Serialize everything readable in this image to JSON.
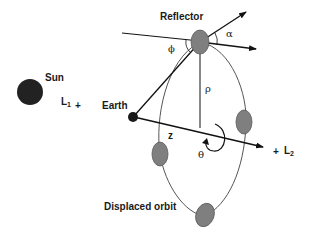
{
  "diagram": {
    "type": "orbital-geometry",
    "colors": {
      "background": "#ffffff",
      "line": "#111111",
      "orbit": "#555555",
      "sun": "#222222",
      "earth": "#1a1a1a",
      "spacecraft_fill": "#7f7f7f",
      "spacecraft_stroke": "#5a5a5a"
    },
    "labels": {
      "reflector": "Reflector",
      "sun": "Sun",
      "l1": "L",
      "l1_sub": "1",
      "l1_marker": "+",
      "earth": "Earth",
      "l2_marker": "+",
      "l2": "L",
      "l2_sub": "2",
      "alpha": "α",
      "phi": "ϕ",
      "rho": "ρ",
      "z": "z",
      "theta": "θ",
      "displaced_orbit": "Displaced orbit"
    },
    "nodes": [
      {
        "id": "sun",
        "label": "Sun"
      },
      {
        "id": "earth",
        "label": "Earth"
      },
      {
        "id": "l1",
        "label": "L1"
      },
      {
        "id": "l2",
        "label": "L2"
      },
      {
        "id": "reflector",
        "label": "Reflector"
      },
      {
        "id": "spacecraft-right",
        "label": ""
      },
      {
        "id": "spacecraft-left",
        "label": ""
      },
      {
        "id": "spacecraft-bottom",
        "label": ""
      }
    ],
    "edges": [
      {
        "from": "earth",
        "to": "l2",
        "label": "z",
        "style": "arrow"
      },
      {
        "from": "earth",
        "to": "reflector",
        "label": "",
        "style": "line"
      },
      {
        "from": "reflector",
        "to": "axis",
        "label": "ρ",
        "style": "line"
      },
      {
        "from": "reflector",
        "to": "outward-normal",
        "label": "α",
        "style": "arrow"
      },
      {
        "from": "reflector",
        "to": "axis-parallel",
        "label": "",
        "style": "arrow"
      }
    ],
    "angles": [
      {
        "symbol": "α",
        "description": "between reflector normal and axis direction"
      },
      {
        "symbol": "ϕ",
        "description": "between incoming line and Earth line"
      },
      {
        "symbol": "θ",
        "description": "rotation about the Earth–L2 axis"
      }
    ]
  }
}
